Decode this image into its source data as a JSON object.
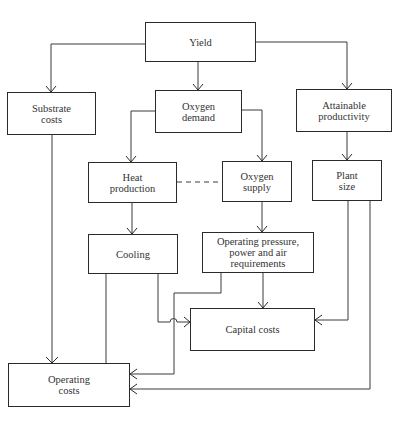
{
  "diagram": {
    "type": "flowchart",
    "nodes": {
      "yield": {
        "label": "Yield"
      },
      "substrate_costs": {
        "label": "Substrate\ncosts"
      },
      "oxygen_demand": {
        "label": "Oxygen\ndemand"
      },
      "attainable_productivity": {
        "label": "Attainable\nproductivity"
      },
      "heat_production": {
        "label": "Heat\nproduction"
      },
      "oxygen_supply": {
        "label": "Oxygen\nsupply"
      },
      "plant_size": {
        "label": "Plant\nsize"
      },
      "cooling": {
        "label": "Cooling"
      },
      "operating_pressure": {
        "label": "Operating pressure,\npower and air\nrequirements"
      },
      "capital_costs": {
        "label": "Capital costs"
      },
      "operating_costs": {
        "label": "Operating\ncosts"
      }
    },
    "edges": [
      {
        "from": "Yield",
        "to": "Substrate costs",
        "style": "solid"
      },
      {
        "from": "Yield",
        "to": "Oxygen demand",
        "style": "solid"
      },
      {
        "from": "Yield",
        "to": "Attainable productivity",
        "style": "solid"
      },
      {
        "from": "Oxygen demand",
        "to": "Heat production",
        "style": "solid"
      },
      {
        "from": "Oxygen demand",
        "to": "Oxygen supply",
        "style": "solid"
      },
      {
        "from": "Attainable productivity",
        "to": "Plant size",
        "style": "solid"
      },
      {
        "from": "Heat production",
        "to": "Oxygen supply",
        "style": "dashed"
      },
      {
        "from": "Heat production",
        "to": "Cooling",
        "style": "solid"
      },
      {
        "from": "Oxygen supply",
        "to": "Operating pressure, power and air requirements",
        "style": "solid"
      },
      {
        "from": "Cooling",
        "to": "Operating costs",
        "style": "solid"
      },
      {
        "from": "Cooling",
        "to": "Capital costs",
        "style": "solid"
      },
      {
        "from": "Operating pressure, power and air requirements",
        "to": "Capital costs",
        "style": "solid"
      },
      {
        "from": "Operating pressure, power and air requirements",
        "to": "Operating costs",
        "style": "solid"
      },
      {
        "from": "Plant size",
        "to": "Capital costs",
        "style": "solid"
      },
      {
        "from": "Plant size",
        "to": "Operating costs",
        "style": "solid"
      },
      {
        "from": "Substrate costs",
        "to": "Operating costs",
        "style": "solid"
      }
    ]
  }
}
